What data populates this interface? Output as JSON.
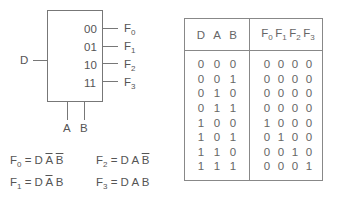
{
  "decoder": {
    "input_label": "D",
    "select_labels": [
      "A",
      "B"
    ],
    "codes": [
      "00",
      "01",
      "10",
      "11"
    ],
    "outputs": [
      {
        "name": "F",
        "sub": "0"
      },
      {
        "name": "F",
        "sub": "1"
      },
      {
        "name": "F",
        "sub": "2"
      },
      {
        "name": "F",
        "sub": "3"
      }
    ]
  },
  "equations": [
    {
      "lhs": "F",
      "sub": "0",
      "eq": "= D",
      "terms": [
        {
          "t": "A",
          "bar": true
        },
        {
          "t": "B",
          "bar": true
        }
      ]
    },
    {
      "lhs": "F",
      "sub": "2",
      "eq": "= D",
      "terms": [
        {
          "t": "A",
          "bar": false
        },
        {
          "t": "B",
          "bar": true
        }
      ]
    },
    {
      "lhs": "F",
      "sub": "1",
      "eq": "= D",
      "terms": [
        {
          "t": "A",
          "bar": true
        },
        {
          "t": "B",
          "bar": false
        }
      ]
    },
    {
      "lhs": "F",
      "sub": "3",
      "eq": "= D",
      "terms": [
        {
          "t": "A",
          "bar": false
        },
        {
          "t": "B",
          "bar": false
        }
      ]
    }
  ],
  "truth_table": {
    "input_headers": [
      "D",
      "A",
      "B"
    ],
    "output_headers": [
      {
        "name": "F",
        "sub": "0"
      },
      {
        "name": "F",
        "sub": "1"
      },
      {
        "name": "F",
        "sub": "2"
      },
      {
        "name": "F",
        "sub": "3"
      }
    ],
    "rows": [
      {
        "in": [
          "0",
          "0",
          "0"
        ],
        "out": [
          "0",
          "0",
          "0",
          "0"
        ]
      },
      {
        "in": [
          "0",
          "0",
          "1"
        ],
        "out": [
          "0",
          "0",
          "0",
          "0"
        ]
      },
      {
        "in": [
          "0",
          "1",
          "0"
        ],
        "out": [
          "0",
          "0",
          "0",
          "0"
        ]
      },
      {
        "in": [
          "0",
          "1",
          "1"
        ],
        "out": [
          "0",
          "0",
          "0",
          "0"
        ]
      },
      {
        "in": [
          "1",
          "0",
          "0"
        ],
        "out": [
          "1",
          "0",
          "0",
          "0"
        ]
      },
      {
        "in": [
          "1",
          "0",
          "1"
        ],
        "out": [
          "0",
          "1",
          "0",
          "0"
        ]
      },
      {
        "in": [
          "1",
          "1",
          "0"
        ],
        "out": [
          "0",
          "0",
          "1",
          "0"
        ]
      },
      {
        "in": [
          "1",
          "1",
          "1"
        ],
        "out": [
          "0",
          "0",
          "0",
          "1"
        ]
      }
    ]
  }
}
